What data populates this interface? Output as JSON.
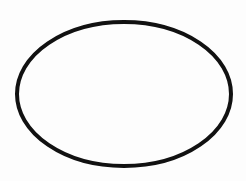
{
  "diagram": {
    "background_color": "#fdfdfd",
    "shapes": [
      {
        "type": "ellipse",
        "cx": 124,
        "cy": 94,
        "rx": 107,
        "ry": 72,
        "stroke": "#111111",
        "stroke_width": 4,
        "fill": "none"
      }
    ]
  }
}
